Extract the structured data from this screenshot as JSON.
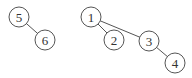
{
  "diagram": {
    "type": "tree-forest",
    "nodes": [
      {
        "id": "5",
        "label": "5",
        "x": 19,
        "y": 17
      },
      {
        "id": "6",
        "label": "6",
        "x": 45,
        "y": 40
      },
      {
        "id": "1",
        "label": "1",
        "x": 91,
        "y": 17
      },
      {
        "id": "2",
        "label": "2",
        "x": 114,
        "y": 40
      },
      {
        "id": "3",
        "label": "3",
        "x": 149,
        "y": 41
      },
      {
        "id": "4",
        "label": "4",
        "x": 175,
        "y": 63
      }
    ],
    "edges": [
      {
        "from": "5",
        "to": "6"
      },
      {
        "from": "1",
        "to": "2"
      },
      {
        "from": "1",
        "to": "3"
      },
      {
        "from": "3",
        "to": "4"
      }
    ]
  }
}
